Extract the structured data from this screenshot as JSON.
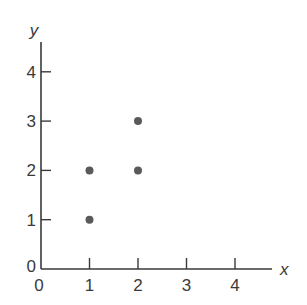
{
  "chart_data": {
    "type": "scatter",
    "title": "",
    "xlabel": "x",
    "ylabel": "y",
    "xlim": [
      0,
      4.8
    ],
    "ylim": [
      0,
      4.6
    ],
    "x_ticks": [
      "1",
      "2",
      "3",
      "4"
    ],
    "y_ticks": [
      "1",
      "2",
      "3",
      "4"
    ],
    "origin_labels": {
      "x": "0",
      "y": "0"
    },
    "grid": false,
    "legend": null,
    "point_color": "#5a5a5a",
    "points": [
      {
        "x": 1,
        "y": 1
      },
      {
        "x": 1,
        "y": 2
      },
      {
        "x": 2,
        "y": 2
      },
      {
        "x": 2,
        "y": 3
      }
    ]
  }
}
